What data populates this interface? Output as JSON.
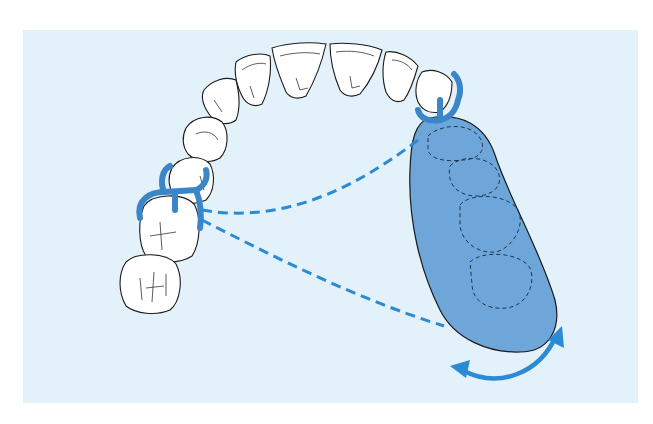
{
  "figure": {
    "type": "dental-diagram",
    "colors": {
      "background_panel": "#e3f1fa",
      "page": "#ffffff",
      "tooth_fill": "#ffffff",
      "outline": "#1a1a1a",
      "clasp": "#3a86c8",
      "saddle_fill": "#6fa6da",
      "dashed_axis": "#2a8ad6",
      "arrow": "#2a8ad6"
    },
    "elements": {
      "teeth_count": 10,
      "clasps": [
        "molar-premolar-clasp",
        "canine-clasp"
      ],
      "denture_base_outlined_teeth": 4,
      "rotation_axes": 2,
      "rotation_arrow": "double-headed-curved"
    }
  }
}
